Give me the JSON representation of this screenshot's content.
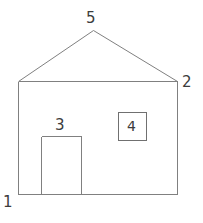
{
  "figure": {
    "kind": "line-drawing",
    "stroke_color": "#808080",
    "window_stroke_color": "#707070",
    "label_color": "#3c3c3c",
    "background_color": "#ffffff",
    "stroke_width": 1
  },
  "labels": {
    "bottom_left_corner": "1",
    "right_eave_corner": "2",
    "door": "3",
    "window": "4",
    "roof_apex": "5"
  },
  "geometry": {
    "wall": {
      "left_x": 18,
      "right_x": 177,
      "top_y": 81,
      "bottom_y": 194
    },
    "roof": {
      "apex_x": 93,
      "apex_y": 30,
      "left_eave_x": 18,
      "left_eave_y": 81,
      "right_eave_x": 177,
      "right_eave_y": 81
    },
    "door": {
      "left_x": 41,
      "right_x": 81,
      "top_y": 136,
      "bottom_y": 194
    },
    "window": {
      "left_x": 118,
      "right_x": 146,
      "top_y": 112,
      "bottom_y": 140
    }
  }
}
